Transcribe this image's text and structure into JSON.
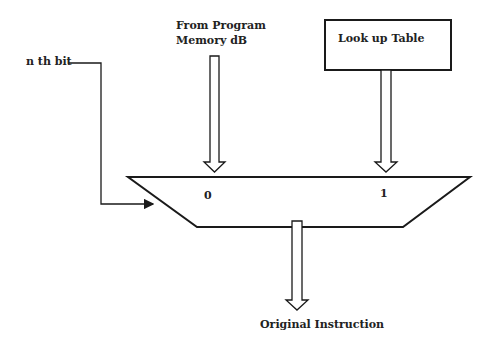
{
  "diagram": {
    "labels": {
      "nth_bit": "n th bit",
      "program_memory_line1": "From Program",
      "program_memory_line2": "Memory dB",
      "lookup_table": "Look up Table",
      "mux_input_0": "0",
      "mux_input_1": "1",
      "output": "Original Instruction"
    },
    "colors": {
      "stroke": "#1a1a1a",
      "background": "#ffffff",
      "text": "#222222"
    }
  }
}
